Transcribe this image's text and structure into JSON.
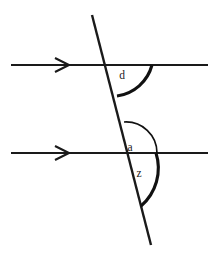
{
  "diagram": {
    "type": "geometry-parallel-lines-transversal",
    "background_color": "#ffffff",
    "stroke_color": "#1a1a1a",
    "labels": {
      "upper_angle": "d",
      "middle_angle": "a",
      "lower_angle": "z"
    },
    "lines": {
      "upper_parallel": {
        "name": "upper-parallel-line",
        "x1": 11,
        "y1": 65,
        "x2": 208,
        "y2": 65,
        "marker": "single-chevron-right"
      },
      "lower_parallel": {
        "name": "lower-parallel-line",
        "x1": 11,
        "y1": 153,
        "x2": 208,
        "y2": 153,
        "marker": "single-chevron-right"
      },
      "transversal": {
        "name": "transversal-line",
        "x1": 92,
        "y1": 15,
        "x2": 151,
        "y2": 245
      }
    },
    "markers": {
      "upper_arrow": {
        "x": 62,
        "y": 65,
        "size": 7
      },
      "lower_arrow": {
        "x": 62,
        "y": 153,
        "size": 7
      }
    },
    "intersections": {
      "upper": {
        "x": 110,
        "y": 65
      },
      "lower": {
        "x": 132,
        "y": 153
      }
    },
    "arcs": {
      "upper_angle_arc": {
        "name": "angle-arc-d",
        "path": "M 152 65 A 42 42 0 0 1 117 96",
        "weight": "thick"
      },
      "middle_angle_arc": {
        "name": "angle-arc-a",
        "path": "M 124 122 A 31 31 0 0 1 157 153",
        "weight": "thin"
      },
      "lower_angle_arc": {
        "name": "angle-arc-z",
        "path": "M 156 153 A 50 50 0 0 1 141 206",
        "weight": "thick"
      }
    },
    "label_positions": {
      "upper_angle": {
        "x": 122,
        "y": 79
      },
      "middle_angle": {
        "x": 130,
        "y": 151
      },
      "lower_angle": {
        "x": 139,
        "y": 177
      }
    }
  }
}
